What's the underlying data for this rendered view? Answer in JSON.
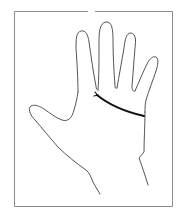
{
  "figure": {
    "highlighted_line": "heart-line",
    "colors": {
      "background": "#ffffff",
      "frame": "#8a8a8a",
      "outline": "#555555",
      "highlight": "#111111"
    }
  }
}
